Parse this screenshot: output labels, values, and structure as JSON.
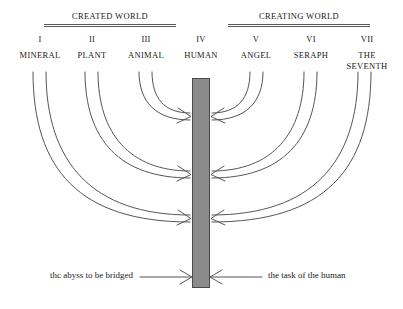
{
  "diagram": {
    "headings": [
      {
        "label": "CREATED WORLD",
        "side": "left"
      },
      {
        "label": "CREATING WORLD",
        "side": "right"
      }
    ],
    "columns": [
      {
        "roman": "I",
        "name": "MINERAL",
        "side": "left",
        "cx": 40,
        "arc_pair": [
          33,
          46
        ]
      },
      {
        "roman": "II",
        "name": "PLANT",
        "side": "left",
        "cx": 92,
        "arc_pair": [
          85,
          98
        ]
      },
      {
        "roman": "III",
        "name": "ANIMAL",
        "side": "left",
        "cx": 146,
        "arc_pair": [
          139,
          152
        ]
      },
      {
        "roman": "IV",
        "name": "HUMAN",
        "side": "center",
        "cx": 201,
        "arc_pair": []
      },
      {
        "roman": "V",
        "name": "ANGEL",
        "side": "right",
        "cx": 256,
        "arc_pair": [
          250,
          263
        ]
      },
      {
        "roman": "VI",
        "name": "SERAPH",
        "side": "right",
        "cx": 311,
        "arc_pair": [
          304,
          317
        ]
      },
      {
        "roman": "VII",
        "name": "THE SEVENTH",
        "side": "right",
        "cx": 365,
        "arc_pair": [
          358,
          371
        ]
      }
    ],
    "center_bar": {
      "label": "abyss-bar",
      "color": "#8b8b8b",
      "x": 192,
      "y": 78,
      "width": 18,
      "height": 210
    },
    "arrow_targets_y": [
      120,
      178,
      222
    ],
    "captions": {
      "left": "thc abyss to be bridged",
      "right": "the task of the human"
    },
    "colors": {
      "bar_fill": "#8b8b8b",
      "bar_stroke": "#4a4a4a",
      "line": "#555555",
      "text": "#1a1a1a"
    }
  }
}
